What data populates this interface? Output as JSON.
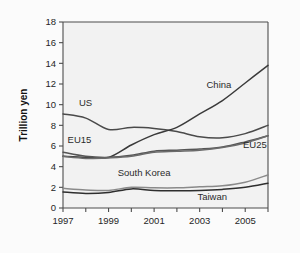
{
  "figure": {
    "background_color": "#fbfbfb",
    "plot_background_color": "#f2f2f2",
    "axis_color": "#4d4d4d"
  },
  "axis": {
    "y_title": "Trillion yen",
    "y_ticks": [
      "0",
      "2",
      "4",
      "6",
      "8",
      "10",
      "12",
      "14",
      "16",
      "18"
    ],
    "x_ticks_major": [
      "1997",
      "1999",
      "2001",
      "2003",
      "2005"
    ]
  },
  "labels": {
    "us": "US",
    "eu15": "EU15",
    "eu25": "EU25",
    "china": "China",
    "south_korea": "South Korea",
    "taiwan": "Taiwan"
  },
  "chart_data": {
    "type": "line",
    "title": "",
    "xlabel": "",
    "ylabel": "Trillion yen",
    "xlim": [
      1997,
      2006
    ],
    "ylim": [
      0,
      18
    ],
    "ytick_values": [
      0,
      2,
      4,
      6,
      8,
      10,
      12,
      14,
      16,
      18
    ],
    "xtick_values": [
      1997,
      1998,
      1999,
      2000,
      2001,
      2002,
      2003,
      2004,
      2005,
      2006
    ],
    "xtick_labels_shown": [
      "1997",
      "",
      "1999",
      "",
      "2001",
      "",
      "2003",
      "",
      "2005",
      ""
    ],
    "grid": false,
    "legend": "inline-annotations",
    "x": [
      1997,
      1998,
      1999,
      2000,
      2001,
      2002,
      2003,
      2004,
      2005,
      2006
    ],
    "series": [
      {
        "name": "US",
        "label_position": {
          "x": 1997.7,
          "y": 9.9
        },
        "color": "#4a4a4a",
        "values": [
          9.1,
          8.7,
          7.6,
          7.8,
          7.7,
          7.4,
          6.9,
          6.8,
          7.2,
          8.0
        ]
      },
      {
        "name": "China",
        "label_position": {
          "x": 2003.3,
          "y": 11.6
        },
        "color": "#3a3a3a",
        "values": [
          5.0,
          4.9,
          4.9,
          6.1,
          7.1,
          7.8,
          9.1,
          10.4,
          12.1,
          13.8
        ]
      },
      {
        "name": "EU15",
        "label_position": {
          "x": 1997.2,
          "y": 6.3
        },
        "color": "#555555",
        "values": [
          5.4,
          5.0,
          4.9,
          5.1,
          5.5,
          5.6,
          5.7,
          5.9,
          6.4,
          7.0
        ]
      },
      {
        "name": "EU25",
        "label_position": {
          "x": 2004.9,
          "y": 5.8
        },
        "color": "#6b6b6b",
        "values": [
          5.0,
          4.8,
          4.85,
          5.0,
          5.4,
          5.5,
          5.6,
          5.85,
          6.3,
          7.0
        ]
      },
      {
        "name": "South Korea",
        "label_position": {
          "x": 1999.4,
          "y": 3.1
        },
        "color": "#8a8a8a",
        "values": [
          1.9,
          1.75,
          1.7,
          2.0,
          1.95,
          1.95,
          2.05,
          2.15,
          2.5,
          3.2
        ]
      },
      {
        "name": "Taiwan",
        "label_position": {
          "x": 2002.9,
          "y": 0.8
        },
        "color": "#2e2e2e",
        "values": [
          1.55,
          1.4,
          1.5,
          1.85,
          1.7,
          1.68,
          1.7,
          1.8,
          2.0,
          2.4
        ]
      }
    ]
  }
}
